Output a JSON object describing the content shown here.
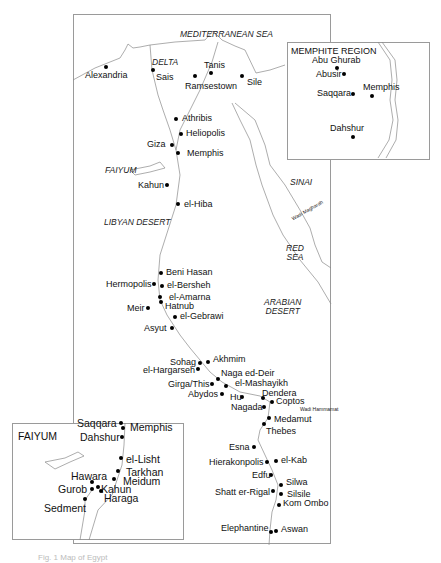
{
  "map": {
    "main": {
      "regions": [
        {
          "id": "mediterranean",
          "label": "MEDITERRANEAN SEA",
          "x": 180,
          "y": 30
        },
        {
          "id": "delta",
          "label": "DELTA",
          "x": 152,
          "y": 58
        },
        {
          "id": "faiyum",
          "label": "FAIYUM",
          "x": 105,
          "y": 166
        },
        {
          "id": "libyan-desert",
          "label": "LIBYAN DESERT",
          "x": 104,
          "y": 218
        },
        {
          "id": "sinai",
          "label": "SINAI",
          "x": 290,
          "y": 178
        },
        {
          "id": "red-sea",
          "label": "RED\nSEA",
          "x": 286,
          "y": 244
        },
        {
          "id": "arabian-desert",
          "label": "ARABIAN\nDESERT",
          "x": 264,
          "y": 298
        },
        {
          "id": "wadi-maghara",
          "label": "Wadi Magharah",
          "x": 290,
          "y": 208
        },
        {
          "id": "wadi-hammamat",
          "label": "Wadi Hammamat",
          "x": 300,
          "y": 407
        }
      ],
      "sites": [
        {
          "name": "Alexandria",
          "dot": [
            106,
            67
          ],
          "lx": 85,
          "ly": 71
        },
        {
          "name": "Sais",
          "dot": [
            153,
            70
          ],
          "lx": 156,
          "ly": 73
        },
        {
          "name": "Tanis",
          "dot": [
            211,
            73
          ],
          "lx": 204,
          "ly": 61
        },
        {
          "name": "Ramsestown",
          "dot": [
            195,
            76
          ],
          "lx": 185,
          "ly": 82
        },
        {
          "name": "Sile",
          "dot": [
            242,
            76
          ],
          "lx": 247,
          "ly": 78
        },
        {
          "name": "Athribis",
          "dot": [
            176,
            119
          ],
          "lx": 182,
          "ly": 114
        },
        {
          "name": "Heliopolis",
          "dot": [
            181,
            134
          ],
          "lx": 186,
          "ly": 129
        },
        {
          "name": "Giza",
          "dot": [
            172,
            145
          ],
          "lx": 147,
          "ly": 140
        },
        {
          "name": "Memphis",
          "dot": [
            178,
            153
          ],
          "lx": 187,
          "ly": 149
        },
        {
          "name": "Kahun",
          "dot": [
            167,
            185
          ],
          "lx": 138,
          "ly": 181
        },
        {
          "name": "el-Hiba",
          "dot": [
            178,
            204
          ],
          "lx": 184,
          "ly": 200
        },
        {
          "name": "Beni Hasan",
          "dot": [
            161,
            273
          ],
          "lx": 166,
          "ly": 268
        },
        {
          "name": "Hermopolis",
          "dot": [
            154,
            284
          ],
          "lx": 106,
          "ly": 280
        },
        {
          "name": "el-Bersheh",
          "dot": [
            162,
            286
          ],
          "lx": 167,
          "ly": 281
        },
        {
          "name": "el-Amarna",
          "dot": [
            160,
            297
          ],
          "lx": 169,
          "ly": 293
        },
        {
          "name": "Hatnub",
          "dot": [
            161,
            302
          ],
          "lx": 165,
          "ly": 302
        },
        {
          "name": "Meir",
          "dot": [
            148,
            308
          ],
          "lx": 127,
          "ly": 304
        },
        {
          "name": "el-Gebrawi",
          "dot": [
            175,
            317
          ],
          "lx": 180,
          "ly": 312
        },
        {
          "name": "Asyut",
          "dot": [
            172,
            328
          ],
          "lx": 144,
          "ly": 324
        },
        {
          "name": "Sohag",
          "dot": [
            200,
            363
          ],
          "lx": 170,
          "ly": 358
        },
        {
          "name": "Akhmim",
          "dot": [
            208,
            362
          ],
          "lx": 213,
          "ly": 355
        },
        {
          "name": "el-Hargarseh",
          "dot": [
            198,
            369
          ],
          "lx": 143,
          "ly": 366
        },
        {
          "name": "Naga ed-Deir",
          "dot": [
            218,
            379
          ],
          "lx": 221,
          "ly": 369
        },
        {
          "name": "Girga/This",
          "dot": [
            212,
            384
          ],
          "lx": 168,
          "ly": 380
        },
        {
          "name": "el-Mashayikh",
          "dot": [
            226,
            386
          ],
          "lx": 235,
          "ly": 379
        },
        {
          "name": "Abydos",
          "dot": [
            222,
            394
          ],
          "lx": 188,
          "ly": 390
        },
        {
          "name": "Hu",
          "dot": [
            242,
            397
          ],
          "lx": 230,
          "ly": 393
        },
        {
          "name": "Dendera",
          "dot": [
            263,
            398
          ],
          "lx": 262,
          "ly": 389
        },
        {
          "name": "Coptos",
          "dot": [
            272,
            402
          ],
          "lx": 276,
          "ly": 397
        },
        {
          "name": "Nagada",
          "dot": [
            264,
            407
          ],
          "lx": 231,
          "ly": 403
        },
        {
          "name": "Medamut",
          "dot": [
            269,
            418
          ],
          "lx": 274,
          "ly": 415
        },
        {
          "name": "Thebes",
          "dot": [
            264,
            424
          ],
          "lx": 266,
          "ly": 427
        },
        {
          "name": "Esna",
          "dot": [
            254,
            447
          ],
          "lx": 229,
          "ly": 443
        },
        {
          "name": "Hierakonpolis",
          "dot": [
            267,
            462
          ],
          "lx": 209,
          "ly": 458
        },
        {
          "name": "el-Kab",
          "dot": [
            276,
            461
          ],
          "lx": 281,
          "ly": 456
        },
        {
          "name": "Edfu",
          "dot": [
            271,
            475
          ],
          "lx": 252,
          "ly": 471
        },
        {
          "name": "Silwa",
          "dot": [
            281,
            485
          ],
          "lx": 286,
          "ly": 478
        },
        {
          "name": "Shatt er-Rigal",
          "dot": [
            273,
            491
          ],
          "lx": 215,
          "ly": 488
        },
        {
          "name": "Silsile",
          "dot": [
            281,
            494
          ],
          "lx": 287,
          "ly": 490
        },
        {
          "name": "Kom Ombo",
          "dot": [
            279,
            505
          ],
          "lx": 283,
          "ly": 499
        },
        {
          "name": "Elephantine",
          "dot": [
            271,
            532
          ],
          "lx": 221,
          "ly": 524
        },
        {
          "name": "Aswan",
          "dot": [
            276,
            531
          ],
          "lx": 281,
          "ly": 525
        }
      ]
    },
    "memphite_inset": {
      "title": "MEMPHITE REGION",
      "sites": [
        {
          "name": "Abu Ghurab",
          "dot": [
            337,
            68
          ],
          "lx": 312,
          "ly": 56
        },
        {
          "name": "Abusir",
          "dot": [
            344,
            74
          ],
          "lx": 316,
          "ly": 70
        },
        {
          "name": "Saqqara",
          "dot": [
            353,
            94
          ],
          "lx": 317,
          "ly": 89
        },
        {
          "name": "Memphis",
          "dot": [
            372,
            96
          ],
          "lx": 363,
          "ly": 83
        },
        {
          "name": "Dahshur",
          "dot": [
            353,
            137
          ],
          "lx": 330,
          "ly": 124
        }
      ]
    },
    "faiyum_inset": {
      "title": "FAIYUM",
      "sites": [
        {
          "name": "Saqqara",
          "dot": [
            121,
            423
          ],
          "lx": 77,
          "ly": 418
        },
        {
          "name": "Memphis",
          "dot": [
            123,
            428
          ],
          "lx": 130,
          "ly": 422
        },
        {
          "name": "Dahshur",
          "dot": [
            122,
            437
          ],
          "lx": 80,
          "ly": 432
        },
        {
          "name": "el-Lisht",
          "dot": [
            121,
            458
          ],
          "lx": 126,
          "ly": 454
        },
        {
          "name": "Tarkhan",
          "dot": [
            118,
            471
          ],
          "lx": 126,
          "ly": 467
        },
        {
          "name": "Meidum",
          "dot": [
            114,
            479
          ],
          "lx": 123,
          "ly": 476
        },
        {
          "name": "Hawara",
          "dot": [
            92,
            482
          ],
          "lx": 71,
          "ly": 471
        },
        {
          "name": "Gurob",
          "dot": [
            92,
            489
          ],
          "lx": 58,
          "ly": 484
        },
        {
          "name": "Kahun",
          "dot": [
            98,
            487
          ],
          "lx": 101,
          "ly": 484,
          "small": true
        },
        {
          "name": "Haraga",
          "dot": [
            101,
            491
          ],
          "lx": 104,
          "ly": 493
        },
        {
          "name": "Sedment",
          "dot": [
            85,
            499
          ],
          "lx": 44,
          "ly": 503
        }
      ]
    }
  },
  "caption": {
    "text": "Fig. 1 Map of Egypt"
  }
}
